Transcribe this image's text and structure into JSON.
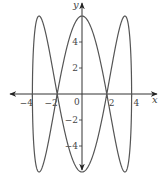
{
  "chart_data": {
    "type": "line",
    "title": "",
    "xlabel": "x",
    "ylabel": "y",
    "xlim": [
      -5.5,
      6
    ],
    "ylim": [
      -6,
      6.8
    ],
    "grid": false,
    "legend": null,
    "x_ticks": [
      -4,
      -2,
      2,
      4
    ],
    "x_tick_labels": [
      "−4",
      "−2",
      "2",
      "4"
    ],
    "y_ticks": [
      4,
      2,
      -2,
      -4
    ],
    "y_tick_labels": [
      "4",
      "2",
      "−2",
      "−4"
    ],
    "origin_label": "0",
    "series": [
      {
        "name": "parametric curve",
        "parametric": {
          "x": "4 sin t",
          "y": "6 cos 3t",
          "t_range": [
            0,
            6.2832
          ]
        },
        "key_points": [
          {
            "x": 0,
            "y": 6
          },
          {
            "x": 3.46,
            "y": 6
          },
          {
            "x": -3.46,
            "y": 6
          },
          {
            "x": 0,
            "y": -6
          },
          {
            "x": 3.46,
            "y": -6
          },
          {
            "x": -3.46,
            "y": -6
          },
          {
            "x": 2,
            "y": 0
          },
          {
            "x": -2,
            "y": 0
          },
          {
            "x": 4,
            "y": 0
          },
          {
            "x": -4,
            "y": 0
          }
        ]
      }
    ],
    "colors": {
      "curve": "#555555",
      "axes": "#333333"
    }
  }
}
